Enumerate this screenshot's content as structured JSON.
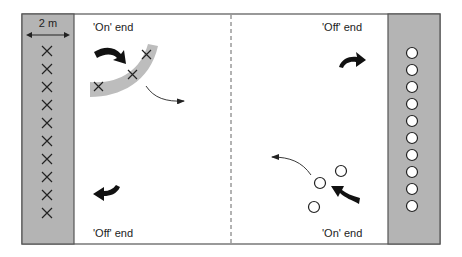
{
  "diagram": {
    "scale_label": "2 m",
    "labels": {
      "top_left": "'On' end",
      "top_right": "'Off' end",
      "bottom_left": "'Off' end",
      "bottom_right": "'On' end"
    },
    "colors": {
      "strip": "#b4b4b4",
      "frame": "#555555",
      "arrow": "#111111",
      "arc_band": "#bdbdbd",
      "circle_fill": "#ffffff"
    },
    "left_team": {
      "symbol": "cross",
      "count": 10
    },
    "right_team": {
      "symbol": "circle",
      "count": 10
    },
    "on_field_left": {
      "symbol": "cross",
      "count": 3
    },
    "on_field_right": {
      "symbol": "circle",
      "count": 3
    }
  }
}
